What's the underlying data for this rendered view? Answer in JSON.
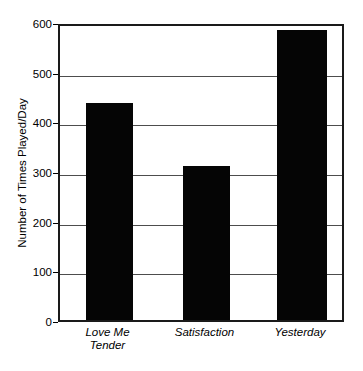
{
  "chart_data": {
    "type": "bar",
    "title": "",
    "xlabel": "",
    "ylabel": "Number of Times Played/Day",
    "categories": [
      "Love Me\nTender",
      "Satisfaction",
      "Yesterday"
    ],
    "values": [
      437,
      310,
      583
    ],
    "ylim": [
      0,
      600
    ],
    "yticks": [
      0,
      100,
      200,
      300,
      400,
      500,
      600
    ],
    "ytick_labels": [
      "0",
      "100",
      "200",
      "300",
      "400",
      "500",
      "600"
    ],
    "grid": "horizontal",
    "legend": "none",
    "bar_color": "#050505",
    "frame_color": "#1a1a1a",
    "gridline_color": "#4d4d4d",
    "background_color": "#ffffff"
  }
}
